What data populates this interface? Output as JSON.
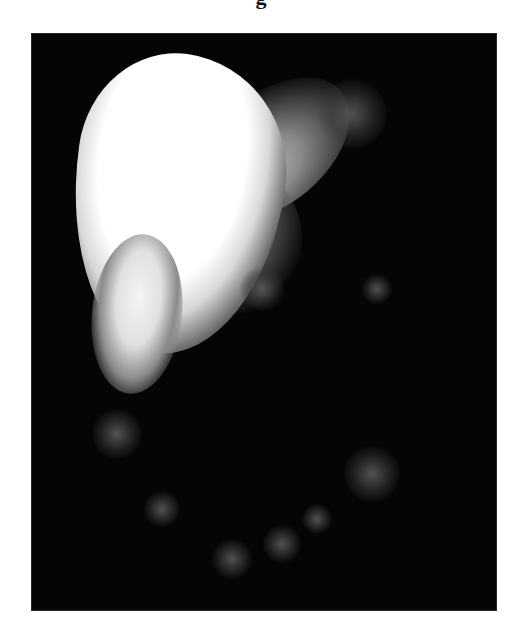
{
  "caption_fragment": "g",
  "figure": {
    "background_color": "#050505",
    "highlight_color": "#ffffff",
    "faint_spots": [
      {
        "x": 320,
        "y": 80,
        "size": 70
      },
      {
        "x": 230,
        "y": 255,
        "size": 44
      },
      {
        "x": 345,
        "y": 255,
        "size": 30
      },
      {
        "x": 85,
        "y": 400,
        "size": 50
      },
      {
        "x": 130,
        "y": 475,
        "size": 36
      },
      {
        "x": 340,
        "y": 440,
        "size": 56
      },
      {
        "x": 285,
        "y": 485,
        "size": 30
      },
      {
        "x": 200,
        "y": 525,
        "size": 40
      },
      {
        "x": 250,
        "y": 510,
        "size": 38
      }
    ]
  }
}
